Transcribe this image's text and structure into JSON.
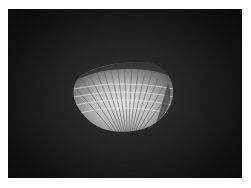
{
  "image": {
    "subject": "cockle shell",
    "description": "Grayscale photograph of a ribbed bivalve shell on a dark vignetted background, with a white border",
    "colors": {
      "border": "#ffffff",
      "background_center": "#3a3a3a",
      "background_edge": "#0a0a0a",
      "shell_highlight": "#e8e8e8",
      "shell_shadow": "#5a5a5a"
    }
  }
}
